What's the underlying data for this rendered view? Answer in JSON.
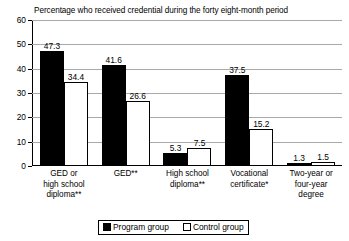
{
  "chart_data": {
    "type": "bar",
    "title": "Percentage who received credential during the forty eight-month period",
    "xlabel": "",
    "ylabel": "",
    "ylim": [
      0,
      60
    ],
    "yticks": [
      0,
      10,
      20,
      30,
      40,
      50,
      60
    ],
    "grid": true,
    "legend_position": "bottom-center",
    "categories": [
      "GED or\nhigh school\ndiploma**",
      "GED**",
      "High school\ndiploma**",
      "Vocational\ncertificate*",
      "Two-year or\nfour-year\ndegree"
    ],
    "series": [
      {
        "name": "Program group",
        "color": "#000000",
        "values": [
          47.3,
          41.6,
          5.3,
          37.5,
          1.3
        ]
      },
      {
        "name": "Control group",
        "color": "#ffffff",
        "values": [
          34.4,
          26.6,
          7.5,
          15.2,
          1.5
        ]
      }
    ]
  },
  "legend": {
    "items": [
      {
        "label": "Program group",
        "swatch": "filled-square-icon"
      },
      {
        "label": "Control group",
        "swatch": "outlined-square-icon"
      }
    ]
  }
}
